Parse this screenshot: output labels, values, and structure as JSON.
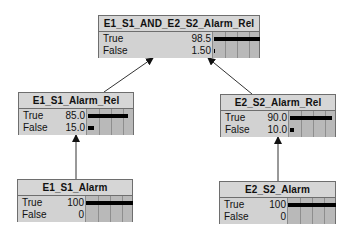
{
  "nodes": {
    "top": {
      "title": "E1_S1_AND_E2_S2_Alarm_Rel",
      "states": [
        {
          "label": "True",
          "value": "98.5",
          "pct": 98.5
        },
        {
          "label": "False",
          "value": "1.50",
          "pct": 1.5
        }
      ]
    },
    "left_mid": {
      "title": "E1_S1_Alarm_Rel",
      "states": [
        {
          "label": "True",
          "value": "85.0",
          "pct": 85.0
        },
        {
          "label": "False",
          "value": "15.0",
          "pct": 15.0
        }
      ]
    },
    "right_mid": {
      "title": "E2_S2_Alarm_Rel",
      "states": [
        {
          "label": "True",
          "value": "90.0",
          "pct": 90.0
        },
        {
          "label": "False",
          "value": "10.0",
          "pct": 10.0
        }
      ]
    },
    "left_bottom": {
      "title": "E1_S1_Alarm",
      "states": [
        {
          "label": "True",
          "value": "100",
          "pct": 100
        },
        {
          "label": "False",
          "value": "0",
          "pct": 0
        }
      ]
    },
    "right_bottom": {
      "title": "E2_S2_Alarm",
      "states": [
        {
          "label": "True",
          "value": "100",
          "pct": 100
        },
        {
          "label": "False",
          "value": "0",
          "pct": 0
        }
      ]
    }
  },
  "edges": [
    {
      "from": "left_bottom",
      "to": "left_mid"
    },
    {
      "from": "right_bottom",
      "to": "right_mid"
    },
    {
      "from": "left_mid",
      "to": "top"
    },
    {
      "from": "right_mid",
      "to": "top"
    }
  ],
  "colors": {
    "node_fill": "#c8c8c8",
    "title_fill": "#d6d6d6",
    "bar": "#000000",
    "edge": "#333333"
  }
}
